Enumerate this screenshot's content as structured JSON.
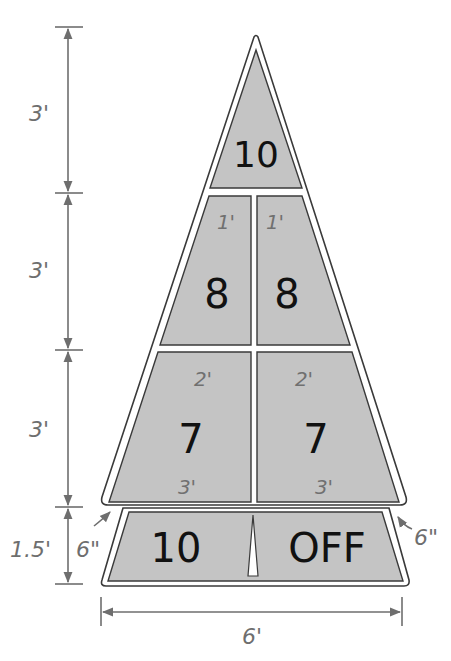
{
  "colors": {
    "zone_fill": "#c4c4c4",
    "outline": "#3a3a3a",
    "dimension": "#6e6e6e",
    "score_text": "#111111",
    "background": "#ffffff"
  },
  "dimensions": {
    "left": [
      {
        "label": "3'"
      },
      {
        "label": "3'"
      },
      {
        "label": "3'"
      },
      {
        "label": "1.5'"
      }
    ],
    "bottom_width": "6'",
    "gap_left": "6\"",
    "gap_right": "6\""
  },
  "zones": {
    "top": {
      "score": "10"
    },
    "row2": {
      "left": {
        "score": "8",
        "width_label": "1'"
      },
      "right": {
        "score": "8",
        "width_label": "1'"
      }
    },
    "row3": {
      "left": {
        "score": "7",
        "top_label": "2'",
        "bottom_label": "3'"
      },
      "right": {
        "score": "7",
        "top_label": "2'",
        "bottom_label": "3'"
      }
    },
    "bottom": {
      "left": {
        "score": "10"
      },
      "right": {
        "score": "OFF"
      }
    }
  }
}
